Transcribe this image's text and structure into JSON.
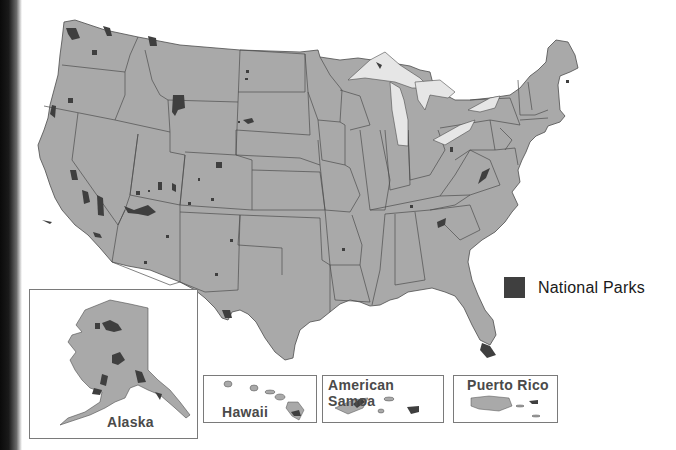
{
  "legend": {
    "label": "National Parks",
    "swatch_color": "#3f3f3f"
  },
  "colors": {
    "land": "#a9a9a9",
    "border": "#4d4d4d",
    "park": "#3f3f3f",
    "lakes": "#e6e6e6",
    "background": "#ffffff"
  },
  "insets": [
    {
      "id": "alaska",
      "label": "Alaska"
    },
    {
      "id": "hawaii",
      "label": "Hawaii"
    },
    {
      "id": "american-samoa",
      "label": "American Samoa"
    },
    {
      "id": "puerto-rico",
      "label": "Puerto Rico"
    }
  ]
}
